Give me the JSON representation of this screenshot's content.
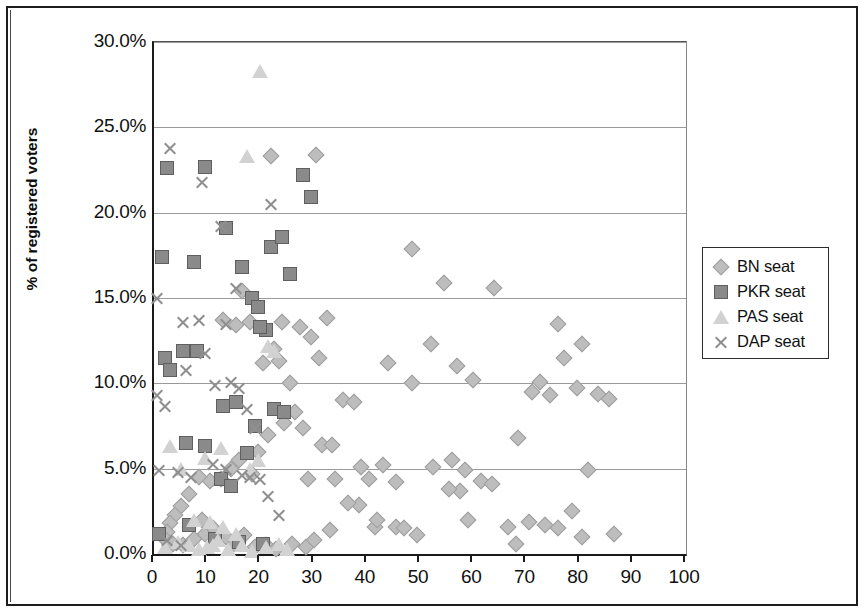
{
  "chart_data": {
    "type": "scatter",
    "title": "",
    "xlabel": "",
    "ylabel": "% of registered voters",
    "xlim": [
      0,
      100
    ],
    "ylim": [
      0,
      0.3
    ],
    "grid": true,
    "legend_position": "right",
    "x_ticks": [
      "0",
      "10",
      "20",
      "30",
      "40",
      "50",
      "60",
      "70",
      "80",
      "90",
      "100"
    ],
    "x_tick_values": [
      0,
      10,
      20,
      30,
      40,
      50,
      60,
      70,
      80,
      90,
      100
    ],
    "y_ticks": [
      "0.0%",
      "5.0%",
      "10.0%",
      "15.0%",
      "20.0%",
      "25.0%",
      "30.0%"
    ],
    "y_tick_values": [
      0,
      5,
      10,
      15,
      20,
      25,
      30
    ],
    "series": [
      {
        "name": "BN seat",
        "marker": "diamond",
        "color": "#bdbdbd",
        "points": [
          [
            48.5,
            17.9
          ],
          [
            54.5,
            15.9
          ],
          [
            64.0,
            15.6
          ],
          [
            30.5,
            23.4
          ],
          [
            22.0,
            23.3
          ],
          [
            44.0,
            11.2
          ],
          [
            57.0,
            11.0
          ],
          [
            52.0,
            12.3
          ],
          [
            60.0,
            10.2
          ],
          [
            72.5,
            10.1
          ],
          [
            79.5,
            9.7
          ],
          [
            83.5,
            9.4
          ],
          [
            85.5,
            9.1
          ],
          [
            76.0,
            13.5
          ],
          [
            80.5,
            12.3
          ],
          [
            77.0,
            11.5
          ],
          [
            31.0,
            11.5
          ],
          [
            32.5,
            13.8
          ],
          [
            29.5,
            12.7
          ],
          [
            27.5,
            13.3
          ],
          [
            24.0,
            13.6
          ],
          [
            22.5,
            12.0
          ],
          [
            23.5,
            11.3
          ],
          [
            20.5,
            11.2
          ],
          [
            18.0,
            13.6
          ],
          [
            16.5,
            15.4
          ],
          [
            15.5,
            13.4
          ],
          [
            13.0,
            13.7
          ],
          [
            35.5,
            9.0
          ],
          [
            37.5,
            8.9
          ],
          [
            31.5,
            6.4
          ],
          [
            33.5,
            6.4
          ],
          [
            39.0,
            5.1
          ],
          [
            43.0,
            5.2
          ],
          [
            40.5,
            4.4
          ],
          [
            45.5,
            4.2
          ],
          [
            48.5,
            10.0
          ],
          [
            52.5,
            5.1
          ],
          [
            56.0,
            5.5
          ],
          [
            58.5,
            4.9
          ],
          [
            61.5,
            4.3
          ],
          [
            63.5,
            4.1
          ],
          [
            57.5,
            3.7
          ],
          [
            55.5,
            3.8
          ],
          [
            68.0,
            0.6
          ],
          [
            70.5,
            1.9
          ],
          [
            73.5,
            1.7
          ],
          [
            76.0,
            1.5
          ],
          [
            78.5,
            2.5
          ],
          [
            80.5,
            1.0
          ],
          [
            86.5,
            1.2
          ],
          [
            68.5,
            6.8
          ],
          [
            71.0,
            9.5
          ],
          [
            74.5,
            9.3
          ],
          [
            49.5,
            1.1
          ],
          [
            45.5,
            1.6
          ],
          [
            41.5,
            1.6
          ],
          [
            38.5,
            2.9
          ],
          [
            36.5,
            3.0
          ],
          [
            42.0,
            2.0
          ],
          [
            25.5,
            10.0
          ],
          [
            26.5,
            8.3
          ],
          [
            28.0,
            7.4
          ],
          [
            24.5,
            7.7
          ],
          [
            21.5,
            7.0
          ],
          [
            19.5,
            6.0
          ],
          [
            18.5,
            4.7
          ],
          [
            16.0,
            5.5
          ],
          [
            14.5,
            5.0
          ],
          [
            12.5,
            4.4
          ],
          [
            10.5,
            4.3
          ],
          [
            8.5,
            4.5
          ],
          [
            6.5,
            3.5
          ],
          [
            5.0,
            2.8
          ],
          [
            4.0,
            2.3
          ],
          [
            3.0,
            1.8
          ],
          [
            2.5,
            1.3
          ],
          [
            2.0,
            0.9
          ],
          [
            3.5,
            0.6
          ],
          [
            5.5,
            0.5
          ],
          [
            7.5,
            0.9
          ],
          [
            9.5,
            1.2
          ],
          [
            11.0,
            1.5
          ],
          [
            13.5,
            1.0
          ],
          [
            15.0,
            0.6
          ],
          [
            17.0,
            1.1
          ],
          [
            19.0,
            0.4
          ],
          [
            21.0,
            0.5
          ],
          [
            23.0,
            0.3
          ],
          [
            26.0,
            0.6
          ],
          [
            28.5,
            0.4
          ],
          [
            30.0,
            0.8
          ],
          [
            34.0,
            4.4
          ],
          [
            29.0,
            4.4
          ],
          [
            33.0,
            1.4
          ],
          [
            9.0,
            2.0
          ],
          [
            66.5,
            1.6
          ],
          [
            81.5,
            4.9
          ],
          [
            47.0,
            1.5
          ],
          [
            59.0,
            2.0
          ]
        ]
      },
      {
        "name": "PKR seat",
        "marker": "square",
        "color": "#8a8a8a",
        "points": [
          [
            2.5,
            22.6
          ],
          [
            9.5,
            22.7
          ],
          [
            28.0,
            22.2
          ],
          [
            29.5,
            20.9
          ],
          [
            1.5,
            17.4
          ],
          [
            13.5,
            19.1
          ],
          [
            22.0,
            18.0
          ],
          [
            24.0,
            18.6
          ],
          [
            7.5,
            17.1
          ],
          [
            16.5,
            16.8
          ],
          [
            25.5,
            16.4
          ],
          [
            18.5,
            15.0
          ],
          [
            19.5,
            14.5
          ],
          [
            21.0,
            13.1
          ],
          [
            20.0,
            13.3
          ],
          [
            2.0,
            11.5
          ],
          [
            3.0,
            10.8
          ],
          [
            5.5,
            11.9
          ],
          [
            13.0,
            8.7
          ],
          [
            15.5,
            8.9
          ],
          [
            22.5,
            8.5
          ],
          [
            24.5,
            8.3
          ],
          [
            6.0,
            6.5
          ],
          [
            9.5,
            6.3
          ],
          [
            12.5,
            4.4
          ],
          [
            14.5,
            4.0
          ],
          [
            17.5,
            5.9
          ],
          [
            19.0,
            7.5
          ],
          [
            1.0,
            1.2
          ],
          [
            6.5,
            1.7
          ],
          [
            11.5,
            0.9
          ],
          [
            16.0,
            0.7
          ],
          [
            20.5,
            0.6
          ],
          [
            8.0,
            11.9
          ]
        ]
      },
      {
        "name": "PAS seat",
        "marker": "triangle",
        "color": "#d2d2d2",
        "points": [
          [
            20.0,
            28.3
          ],
          [
            17.5,
            23.3
          ],
          [
            21.5,
            12.2
          ],
          [
            22.5,
            11.9
          ],
          [
            12.5,
            6.2
          ],
          [
            18.0,
            5.0
          ],
          [
            19.5,
            5.5
          ],
          [
            9.5,
            5.6
          ],
          [
            3.0,
            6.3
          ],
          [
            5.0,
            5.0
          ],
          [
            7.5,
            2.0
          ],
          [
            10.5,
            1.9
          ],
          [
            13.0,
            1.6
          ],
          [
            15.5,
            1.2
          ],
          [
            2.0,
            0.4
          ],
          [
            4.5,
            0.7
          ],
          [
            6.5,
            0.5
          ],
          [
            8.5,
            0.3
          ],
          [
            11.0,
            0.5
          ],
          [
            14.0,
            0.3
          ],
          [
            16.5,
            0.5
          ],
          [
            18.5,
            0.2
          ],
          [
            21.0,
            0.4
          ],
          [
            23.5,
            0.6
          ],
          [
            25.0,
            0.3
          ],
          [
            12.0,
            0.8
          ],
          [
            10.0,
            0.4
          ]
        ]
      },
      {
        "name": "DAP seat",
        "marker": "cross",
        "color": "#8f8f8f",
        "points": [
          [
            3.0,
            23.8
          ],
          [
            9.0,
            21.8
          ],
          [
            12.5,
            19.2
          ],
          [
            22.0,
            20.5
          ],
          [
            0.5,
            15.0
          ],
          [
            15.5,
            15.6
          ],
          [
            5.5,
            13.6
          ],
          [
            8.5,
            13.7
          ],
          [
            13.5,
            13.5
          ],
          [
            9.5,
            11.8
          ],
          [
            6.0,
            10.8
          ],
          [
            0.5,
            9.3
          ],
          [
            2.0,
            8.7
          ],
          [
            14.5,
            10.1
          ],
          [
            16.0,
            9.7
          ],
          [
            17.5,
            8.5
          ],
          [
            19.0,
            7.4
          ],
          [
            11.0,
            5.3
          ],
          [
            13.5,
            5.0
          ],
          [
            16.5,
            4.6
          ],
          [
            18.0,
            4.5
          ],
          [
            21.5,
            3.4
          ],
          [
            23.5,
            2.3
          ],
          [
            1.0,
            4.9
          ],
          [
            4.5,
            4.8
          ],
          [
            7.0,
            4.5
          ],
          [
            2.5,
            0.8
          ],
          [
            5.0,
            0.5
          ],
          [
            20.0,
            4.4
          ],
          [
            11.5,
            9.9
          ]
        ]
      }
    ]
  },
  "legend": {
    "items": [
      {
        "label": "BN seat",
        "marker": "diamond-icon"
      },
      {
        "label": "PKR seat",
        "marker": "square-icon"
      },
      {
        "label": "PAS seat",
        "marker": "triangle-icon"
      },
      {
        "label": "DAP seat",
        "marker": "cross-icon"
      }
    ]
  },
  "colors": {
    "bn": "#bdbdbd",
    "pkr": "#8a8a8a",
    "pas": "#d2d2d2",
    "dap": "#8f8f8f",
    "axis": "#1a1a1a",
    "grid": "#9a9a9a",
    "frame": "#1d1d1d"
  }
}
